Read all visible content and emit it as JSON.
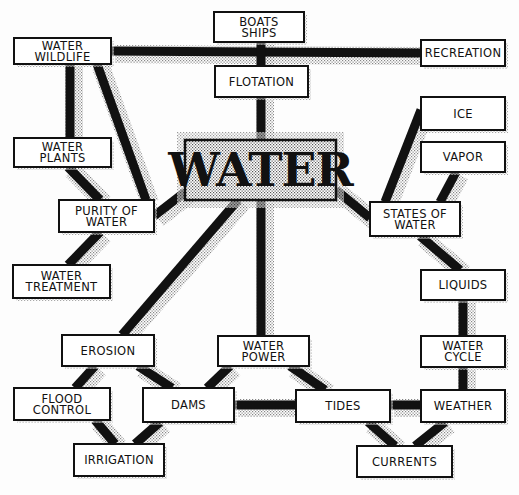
{
  "diagram": {
    "center": {
      "id": "water",
      "label": "WATER"
    },
    "nodes": [
      {
        "id": "boats",
        "lines": [
          "BOATS",
          "SHIPS"
        ]
      },
      {
        "id": "wildlife",
        "lines": [
          "WATER",
          "WILDLIFE"
        ]
      },
      {
        "id": "recreation",
        "lines": [
          "RECREATION"
        ]
      },
      {
        "id": "flotation",
        "lines": [
          "FLOTATION"
        ]
      },
      {
        "id": "ice",
        "lines": [
          "ICE"
        ]
      },
      {
        "id": "plants",
        "lines": [
          "WATER",
          "PLANTS"
        ]
      },
      {
        "id": "vapor",
        "lines": [
          "VAPOR"
        ]
      },
      {
        "id": "purity",
        "lines": [
          "PURITY OF",
          "WATER"
        ]
      },
      {
        "id": "states",
        "lines": [
          "STATES OF",
          "WATER"
        ]
      },
      {
        "id": "treatment",
        "lines": [
          "WATER",
          "TREATMENT"
        ]
      },
      {
        "id": "liquids",
        "lines": [
          "LIQUIDS"
        ]
      },
      {
        "id": "erosion",
        "lines": [
          "EROSION"
        ]
      },
      {
        "id": "power",
        "lines": [
          "WATER",
          "POWER"
        ]
      },
      {
        "id": "cycle",
        "lines": [
          "WATER",
          "CYCLE"
        ]
      },
      {
        "id": "flood",
        "lines": [
          "FLOOD",
          "CONTROL"
        ]
      },
      {
        "id": "dams",
        "lines": [
          "DAMS"
        ]
      },
      {
        "id": "tides",
        "lines": [
          "TIDES"
        ]
      },
      {
        "id": "weather",
        "lines": [
          "WEATHER"
        ]
      },
      {
        "id": "irrigation",
        "lines": [
          "IRRIGATION"
        ]
      },
      {
        "id": "currents",
        "lines": [
          "CURRENTS"
        ]
      }
    ],
    "edges": [
      [
        "wildlife",
        "recreation"
      ],
      [
        "boats",
        "flotation"
      ],
      [
        "flotation",
        "water"
      ],
      [
        "wildlife",
        "plants"
      ],
      [
        "wildlife",
        "purity"
      ],
      [
        "plants",
        "purity"
      ],
      [
        "purity",
        "water"
      ],
      [
        "purity",
        "treatment"
      ],
      [
        "water",
        "erosion"
      ],
      [
        "water",
        "power"
      ],
      [
        "water",
        "states"
      ],
      [
        "states",
        "ice"
      ],
      [
        "states",
        "vapor"
      ],
      [
        "states",
        "liquids"
      ],
      [
        "liquids",
        "cycle"
      ],
      [
        "cycle",
        "weather"
      ],
      [
        "erosion",
        "flood"
      ],
      [
        "erosion",
        "dams"
      ],
      [
        "flood",
        "irrigation"
      ],
      [
        "dams",
        "irrigation"
      ],
      [
        "power",
        "dams"
      ],
      [
        "power",
        "tides"
      ],
      [
        "dams",
        "tides"
      ],
      [
        "tides",
        "weather"
      ],
      [
        "tides",
        "currents"
      ],
      [
        "weather",
        "currents"
      ]
    ]
  }
}
